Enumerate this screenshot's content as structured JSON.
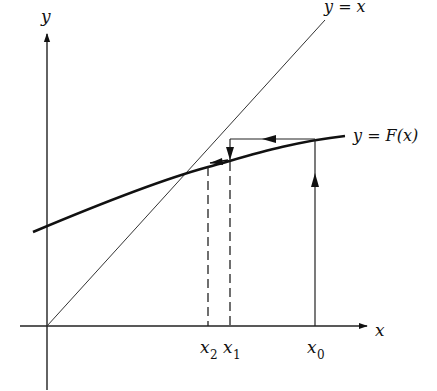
{
  "figure": {
    "type": "fixed-point-iteration-diagram",
    "axes": {
      "x_label": "x",
      "y_label": "y"
    },
    "curves": [
      {
        "name": "identity-line",
        "label": "y = x"
      },
      {
        "name": "F-curve",
        "label": "y = F(x)"
      }
    ],
    "tick_labels": [
      {
        "var": "x",
        "sub": "2"
      },
      {
        "var": "x",
        "sub": "1"
      },
      {
        "var": "x",
        "sub": "0"
      }
    ],
    "labels": {
      "y_axis": "y",
      "x_axis": "x",
      "line_yx": "y = x",
      "curve_F": "y = F(x)",
      "x2_var": "x",
      "x2_sub": "2",
      "x1_var": "x",
      "x1_sub": "1",
      "x0_var": "x",
      "x0_sub": "0"
    },
    "colors": {
      "ink": "#111111",
      "background": "#ffffff"
    }
  }
}
